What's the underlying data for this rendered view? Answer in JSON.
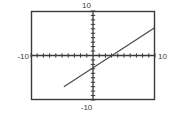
{
  "graph": {
    "labels": {
      "top": "10",
      "bottom": "-10",
      "left": "-10",
      "right": "10"
    },
    "colors": {
      "background": "#ffffff",
      "frame": "#3a3a3a",
      "axis": "#3a3a3a",
      "tick": "#3a3a3a",
      "line": "#4a4a4a",
      "label_text": "#3d3d3d"
    }
  },
  "chart_data": {
    "type": "line",
    "title": "",
    "subtitle": "",
    "xlabel": "",
    "ylabel": "",
    "xlim": [
      -10,
      10
    ],
    "ylim": [
      -10,
      10
    ],
    "xticks": [
      -10,
      -9,
      -8,
      -7,
      -6,
      -5,
      -4,
      -3,
      -2,
      -1,
      1,
      2,
      3,
      4,
      5,
      6,
      7,
      8,
      9,
      10
    ],
    "yticks": [
      -10,
      -9,
      -8,
      -7,
      -6,
      -5,
      -4,
      -3,
      -2,
      -1,
      1,
      2,
      3,
      4,
      5,
      6,
      7,
      8,
      9,
      10
    ],
    "xtick_labels": [
      "-10",
      "10"
    ],
    "ytick_labels": [
      "-10",
      "10"
    ],
    "tick_interval": 1,
    "grid": false,
    "legend": "none",
    "annotations": [],
    "series": [
      {
        "name": "line",
        "slope": 0.9,
        "intercept": -2.7,
        "equation": "y = 0.9x - 2.7",
        "x_intercept": 3,
        "y_intercept": -2.7,
        "x": [
          -4.7,
          10
        ],
        "y": [
          -7,
          6.3
        ],
        "color": "#4a4a4a"
      }
    ]
  }
}
